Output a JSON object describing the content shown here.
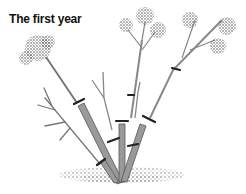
{
  "title": "The first year",
  "illustration": {
    "subject": "shrub-pruning-diagram",
    "colors": {
      "stem": "#8a8a8a",
      "stem_outline": "#555555",
      "flower": "#6a6a6a",
      "cut_mark": "#222222",
      "soil": "#888888"
    }
  }
}
